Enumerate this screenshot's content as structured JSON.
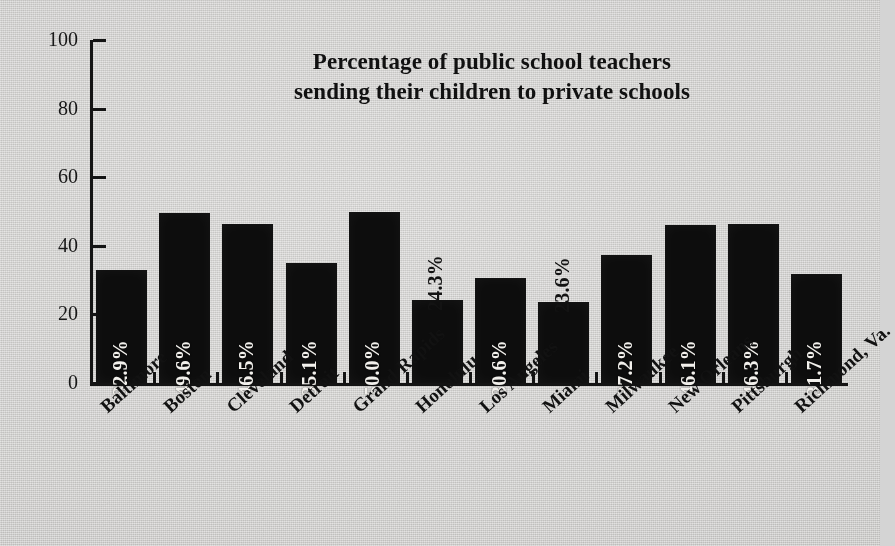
{
  "chart_data": {
    "type": "bar",
    "title": "Percentage of public school teachers sending their children to private schools",
    "title_lines": [
      "Percentage of public school teachers",
      "sending their children to private schools"
    ],
    "xlabel": "",
    "ylabel": "",
    "ylim": [
      0,
      100
    ],
    "yticks": [
      0,
      20,
      40,
      60,
      80,
      100
    ],
    "ytick_labels": [
      "0",
      "20",
      "40",
      "60",
      "80",
      "100"
    ],
    "grid": false,
    "legend": false,
    "orientation": "vertical",
    "categories": [
      "Baltimore",
      "Boston",
      "Cleveland",
      "Detroit",
      "Grand Rapids",
      "Honolulu",
      "Los Angeles",
      "Miami",
      "Milwaukee",
      "New Orleans",
      "Pittsburgh",
      "Richmond, Va."
    ],
    "values": [
      32.9,
      49.6,
      46.5,
      35.1,
      50.0,
      24.3,
      30.6,
      23.6,
      37.2,
      46.1,
      46.3,
      31.7
    ],
    "value_labels": [
      "32.9%",
      "49.6%",
      "46.5%",
      "35.1%",
      "50.0%",
      "24.3%",
      "30.6%",
      "23.6%",
      "37.2%",
      "46.1%",
      "46.3%",
      "31.7%"
    ],
    "label_placement": [
      "inside",
      "inside",
      "inside",
      "inside",
      "inside",
      "outside",
      "inside",
      "outside",
      "inside",
      "inside",
      "inside",
      "inside"
    ],
    "label_rotation_deg": 90,
    "category_label_rotation_deg": 45,
    "colors": {
      "bar": "#0d0d0d",
      "background": "#d4d3d1",
      "axis": "#141414",
      "inside_label_text": "#f2f0ec",
      "outside_label_text": "#131313",
      "title_text": "#111111",
      "tick_label_text": "#181818"
    }
  }
}
